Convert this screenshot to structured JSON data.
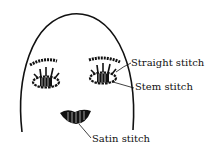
{
  "diagram": {
    "labels": {
      "straight": "Straight stitch",
      "stem": "Stem stitch",
      "satin": "Satin stitch"
    },
    "colors": {
      "ink": "#111111",
      "background": "#ffffff"
    }
  }
}
